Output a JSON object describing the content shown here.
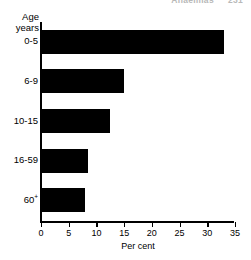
{
  "header": {
    "running_title": "Anaemias",
    "page_number": "231"
  },
  "chart_data": {
    "type": "bar",
    "orientation": "horizontal",
    "title": "",
    "subtitle": "",
    "xlabel": "Per cent",
    "ylabel": "Age years",
    "ylabel_line1": "Age",
    "ylabel_line2": "years",
    "categories": [
      "0-5",
      "6-9",
      "10-15",
      "16-59",
      "60+"
    ],
    "values": [
      33,
      15,
      12.5,
      8.5,
      8
    ],
    "xlim": [
      0,
      35
    ],
    "xticks": [
      0,
      5,
      10,
      15,
      20,
      25,
      30,
      35
    ],
    "xtick_labels": [
      "0",
      "5",
      "10",
      "15",
      "20",
      "25",
      "30",
      "35"
    ],
    "grid": false,
    "legend": false,
    "bar_color": "#000000",
    "axis_color": "#000000",
    "background": "#ffffff"
  }
}
